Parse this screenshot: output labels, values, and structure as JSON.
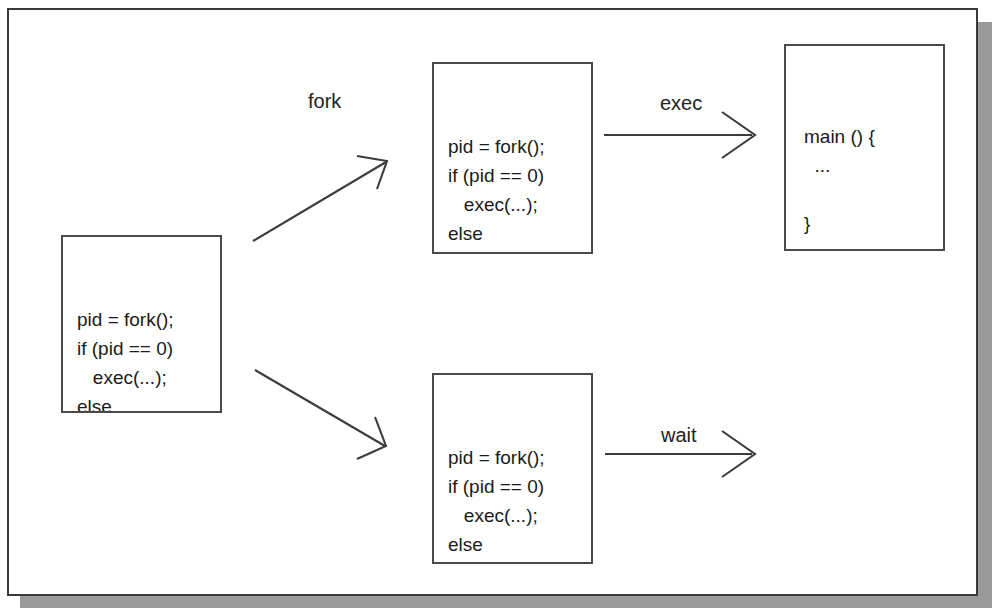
{
  "figure": {
    "background_color": "#ffffff",
    "frame_border_color": "#3a3a3a",
    "shadow_color": "#9a9a9a",
    "text_color": "#1a1a1a"
  },
  "boxes": {
    "parent": {
      "name": "parent-process-code",
      "code": "pid = fork();\nif (pid == 0)\n   exec(...);\nelse\n   wait(pid);"
    },
    "child_top": {
      "name": "child-process-code-top",
      "code": "pid = fork();\nif (pid == 0)\n   exec(...);\nelse\n   wait(pid);"
    },
    "child_bottom": {
      "name": "child-process-code-bottom",
      "code": "pid = fork();\nif (pid == 0)\n   exec(...);\nelse\n   wait(pid);"
    },
    "main_program": {
      "name": "main-program-code",
      "code": "main () {\n  ...\n\n}"
    }
  },
  "edges": {
    "fork": {
      "label": "fork"
    },
    "exec": {
      "label": "exec"
    },
    "wait": {
      "label": "wait"
    }
  }
}
